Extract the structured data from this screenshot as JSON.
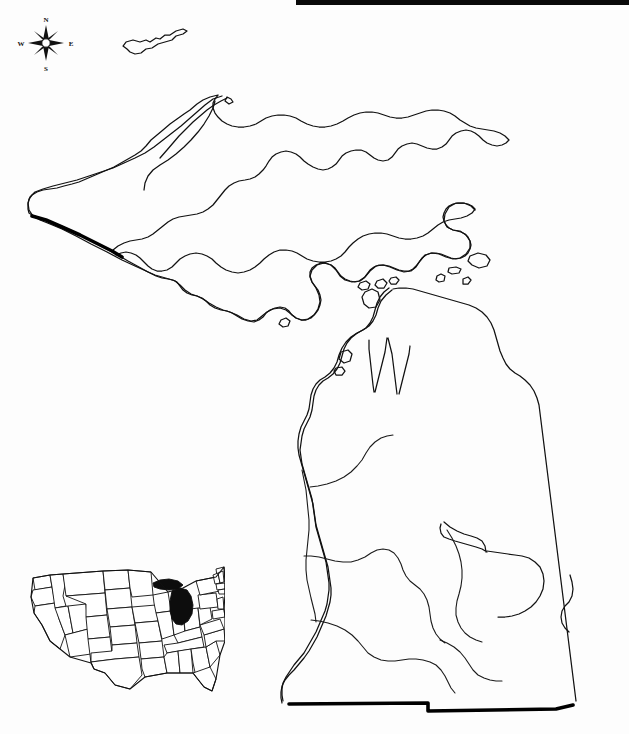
{
  "page": {
    "background_color": "#fdfdfd",
    "width": 629,
    "height": 734
  },
  "header_band": {
    "present": true,
    "color": "#0a0a0a",
    "text": ""
  },
  "compass": {
    "name": "compass-rose",
    "north": "N",
    "east": "E",
    "south": "S",
    "west": "W"
  },
  "map": {
    "subject": "Michigan",
    "style": "outline",
    "line_color": "#111111",
    "fill_color": "#ffffff",
    "features": {
      "upper_peninsula": "Upper Peninsula",
      "lower_peninsula": "Lower Peninsula",
      "isle_royale": "Isle Royale",
      "keweenaw_peninsula": "Keweenaw Peninsula",
      "saginaw_bay": "Saginaw Bay",
      "grand_traverse_bay": "Grand Traverse Bay",
      "straits_of_mackinac": "Straits of Mackinac",
      "the_thumb": "The Thumb",
      "beaver_island": "Beaver Island",
      "drummond_island": "Drummond Island"
    },
    "bold_borders": {
      "wisconsin_border": "Wisconsin state line",
      "southern_border": "Ohio and Indiana state line",
      "color": "#000000"
    },
    "internal_lines": "rivers and watershed boundaries"
  },
  "inset": {
    "name": "united-states-locator-inset",
    "subject": "Contiguous United States",
    "highlighted_state": "Michigan",
    "highlight_color": "#0d0d0d",
    "state_fill": "#ffffff",
    "state_stroke": "#111111"
  }
}
